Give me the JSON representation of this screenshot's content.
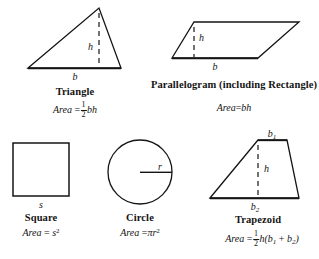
{
  "page": {
    "background_color": "#ffffff",
    "stroke_color": "#141414",
    "text_color": "#141414",
    "width": 319,
    "height": 259
  },
  "figures": [
    {
      "id": "triangle",
      "shape": "triangle",
      "name": "Triangle",
      "base_label": "b",
      "height_label": "h",
      "formula_prefix": "Area",
      "formula_equals": "=",
      "fraction_numerator": "1",
      "fraction_denominator": "2",
      "formula_tail": "bh"
    },
    {
      "id": "parallelogram",
      "shape": "parallelogram",
      "name": "Parallelogram (including Rectangle)",
      "base_label": "b",
      "height_label": "h",
      "formula_prefix": "Area",
      "formula_equals": "=",
      "formula_tail": "bh"
    },
    {
      "id": "square",
      "shape": "square",
      "name": "Square",
      "side_label": "s",
      "formula_prefix": "Area",
      "formula_equals": "=",
      "formula_base": "s",
      "formula_exponent": "2"
    },
    {
      "id": "circle",
      "shape": "circle",
      "name": "Circle",
      "radius_label": "r",
      "formula_prefix": "Area",
      "formula_equals": "=",
      "formula_pi": "π",
      "formula_base": "r",
      "formula_exponent": "2"
    },
    {
      "id": "trapezoid",
      "shape": "trapezoid",
      "name": "Trapezoid",
      "top_base_label": "b",
      "top_base_sub": "1",
      "bottom_base_label": "b",
      "bottom_base_sub": "2",
      "height_label": "h",
      "formula_prefix": "Area",
      "formula_equals": "=",
      "fraction_numerator": "1",
      "fraction_denominator": "2",
      "formula_tail_h": "h(",
      "formula_b1": "b",
      "formula_b1_sub": "1",
      "formula_plus": "+",
      "formula_b2": "b",
      "formula_b2_sub": "2",
      "formula_close": ")"
    }
  ]
}
